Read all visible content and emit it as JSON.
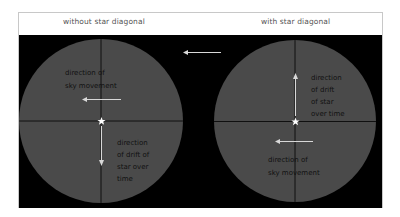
{
  "header": {
    "left_title": "without star diagonal",
    "right_title": "with star diagonal"
  },
  "colors": {
    "panel_bg": "#000000",
    "field_fill": "#4a4a4a",
    "crosshair": "#0a0a0a",
    "arrow": "#d8d8d8",
    "label_text": "#111111",
    "star": "#ffffff"
  },
  "left_view": {
    "sky_label_lines": [
      "direction of",
      "sky movement"
    ],
    "drift_label_lines": [
      "direction",
      "of drift of",
      "star over",
      "time"
    ],
    "sky_arrow": "left",
    "drift_arrow": "down"
  },
  "right_view": {
    "drift_label_lines": [
      "direction",
      "of drift",
      "of star",
      "over time"
    ],
    "sky_label_lines": [
      "direction of",
      "sky movement"
    ],
    "sky_arrow": "left",
    "drift_arrow": "up"
  },
  "center_arrow": "left"
}
